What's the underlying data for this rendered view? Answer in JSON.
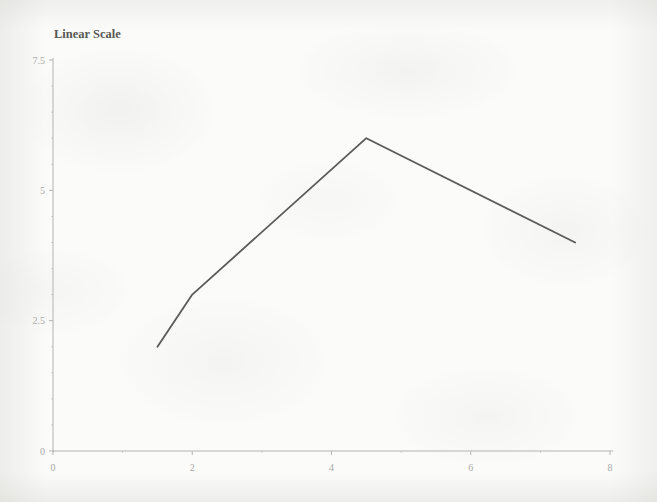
{
  "chart_data": {
    "type": "line",
    "title": "Linear Scale",
    "xlabel": "",
    "ylabel": "",
    "xlim": [
      0,
      8
    ],
    "ylim": [
      0,
      7.5
    ],
    "grid": false,
    "legend": null,
    "x_ticks": [
      "0",
      "2",
      "4",
      "6",
      "8"
    ],
    "x_tick_values": [
      0,
      2,
      4,
      6,
      8
    ],
    "y_ticks": [
      "0",
      "2.5",
      "5",
      "7.5"
    ],
    "y_tick_values": [
      0,
      2.5,
      5,
      7.5
    ],
    "x_minor_tick_values": [
      1,
      3,
      5,
      7
    ],
    "y_minor_tick_values": [
      0.5,
      1,
      1.5,
      2,
      3,
      3.5,
      4,
      4.5,
      5.5,
      6,
      6.5,
      7
    ],
    "series": [
      {
        "name": "curve",
        "x": [
          1.5,
          2.0,
          4.5,
          7.5
        ],
        "values": [
          2.0,
          3.0,
          6.0,
          4.0
        ],
        "color": "#5a5a56",
        "line_width": 1.8,
        "markers": false
      }
    ]
  },
  "colors": {
    "page_background": "#fbfbfa",
    "axis": "#b4b4b0",
    "tick_label": "#a9a9a5",
    "title": "#575753",
    "data_line": "#5a5a56"
  },
  "geometry": {
    "plot_left_px": 53,
    "plot_right_px": 610,
    "plot_top_px": 60,
    "plot_bottom_px": 451
  }
}
